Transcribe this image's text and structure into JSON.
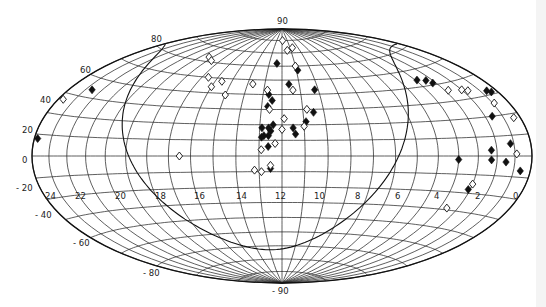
{
  "chart_data": {
    "type": "scatter",
    "projection": "Hammer-Aitoff all-sky (equatorial coordinates)",
    "title": "",
    "xlabel": "Right ascension (h)",
    "ylabel": "Declination (deg)",
    "x_ticks": [
      "24",
      "22",
      "20",
      "18",
      "16",
      "14",
      "12",
      "10",
      "8",
      "6",
      "4",
      "2",
      "0"
    ],
    "y_ticks": [
      "90",
      "80",
      "60",
      "40",
      "20",
      "0",
      "-20",
      "-40",
      "-60",
      "-80",
      "-90"
    ],
    "xlim": [
      24,
      0
    ],
    "ylim": [
      -90,
      90
    ],
    "grid": true,
    "legend": null,
    "curves": [
      {
        "name": "galactic plane",
        "style": "solid"
      }
    ],
    "series": [
      {
        "name": "filled diamonds",
        "marker": "filled-diamond",
        "points": [
          {
            "ra": 23.8,
            "dec": 8
          },
          {
            "ra": 22.6,
            "dec": 34
          },
          {
            "ra": 12.4,
            "dec": 62
          },
          {
            "ra": 11.6,
            "dec": 47
          },
          {
            "ra": 12.7,
            "dec": 40
          },
          {
            "ra": 12.7,
            "dec": 32
          },
          {
            "ra": 12.5,
            "dec": 36
          },
          {
            "ra": 10.9,
            "dec": 57
          },
          {
            "ra": 10.2,
            "dec": 43
          },
          {
            "ra": 10.5,
            "dec": 28
          },
          {
            "ra": 10.9,
            "dec": 22
          },
          {
            "ra": 12.9,
            "dec": 18
          },
          {
            "ra": 12.6,
            "dec": 18
          },
          {
            "ra": 12.5,
            "dec": 16
          },
          {
            "ra": 12.6,
            "dec": 13
          },
          {
            "ra": 12.8,
            "dec": 13
          },
          {
            "ra": 12.4,
            "dec": 20
          },
          {
            "ra": 12.9,
            "dec": 12
          },
          {
            "ra": 11.5,
            "dec": 18
          },
          {
            "ra": 11.4,
            "dec": 14
          },
          {
            "ra": 12.6,
            "dec": 6
          },
          {
            "ra": 12.5,
            "dec": -8
          },
          {
            "ra": 3.9,
            "dec": 44
          },
          {
            "ra": 3.4,
            "dec": 43
          },
          {
            "ra": 3.2,
            "dec": 41
          },
          {
            "ra": 0.6,
            "dec": 32
          },
          {
            "ra": 0.4,
            "dec": 31
          },
          {
            "ra": 1.6,
            "dec": 20
          },
          {
            "ra": 1.2,
            "dec": 6
          },
          {
            "ra": 2.3,
            "dec": 3
          },
          {
            "ra": 2.3,
            "dec": -2
          },
          {
            "ra": 1.5,
            "dec": -3
          },
          {
            "ra": 0.6,
            "dec": -7
          },
          {
            "ra": 4.0,
            "dec": -2
          },
          {
            "ra": 3.1,
            "dec": -18
          }
        ]
      },
      {
        "name": "open diamonds",
        "marker": "open-diamond",
        "points": [
          {
            "ra": 23.7,
            "dec": 27
          },
          {
            "ra": 18.3,
            "dec": 63
          },
          {
            "ra": 17.7,
            "dec": 61
          },
          {
            "ra": 16.6,
            "dec": 50
          },
          {
            "ra": 16.0,
            "dec": 44
          },
          {
            "ra": 15.6,
            "dec": 48
          },
          {
            "ra": 15.0,
            "dec": 39
          },
          {
            "ra": 13.7,
            "dec": 47
          },
          {
            "ra": 12.8,
            "dec": 43
          },
          {
            "ra": 11.9,
            "dec": 80
          },
          {
            "ra": 11.4,
            "dec": 72
          },
          {
            "ra": 10.7,
            "dec": 74
          },
          {
            "ra": 11.0,
            "dec": 60
          },
          {
            "ra": 11.4,
            "dec": 43
          },
          {
            "ra": 10.8,
            "dec": 30
          },
          {
            "ra": 11.9,
            "dec": 24
          },
          {
            "ra": 12.0,
            "dec": 17
          },
          {
            "ra": 12.6,
            "dec": 30
          },
          {
            "ra": 11.0,
            "dec": 19
          },
          {
            "ra": 12.3,
            "dec": 8
          },
          {
            "ra": 12.9,
            "dec": 4
          },
          {
            "ra": 12.5,
            "dec": -6
          },
          {
            "ra": 12.9,
            "dec": -10
          },
          {
            "ra": 13.2,
            "dec": -9
          },
          {
            "ra": 16.5,
            "dec": 0
          },
          {
            "ra": 2.8,
            "dec": 36
          },
          {
            "ra": 2.0,
            "dec": 35
          },
          {
            "ra": 1.7,
            "dec": 34
          },
          {
            "ra": 0.9,
            "dec": 26
          },
          {
            "ra": 0.4,
            "dec": 18
          },
          {
            "ra": 0.9,
            "dec": 1
          },
          {
            "ra": 3.0,
            "dec": -15
          },
          {
            "ra": 3.6,
            "dec": -29
          }
        ]
      }
    ]
  },
  "figure": {
    "labels": {
      "dec_90": "90",
      "dec_80": "80",
      "dec_60": "60",
      "dec_40": "40",
      "dec_20": "20",
      "dec_0": "0",
      "dec_m20": "- 20",
      "dec_m40": "- 40",
      "dec_m60": "- 60",
      "dec_m80": "- 80",
      "dec_m90": "- 90",
      "ra": [
        "24",
        "22",
        "20",
        "18",
        "16",
        "14",
        "12",
        "10",
        "8",
        "6",
        "4",
        "2",
        "0"
      ]
    },
    "geometry": {
      "cx": 282,
      "cy": 156,
      "rx": 250,
      "ry": 127
    }
  }
}
